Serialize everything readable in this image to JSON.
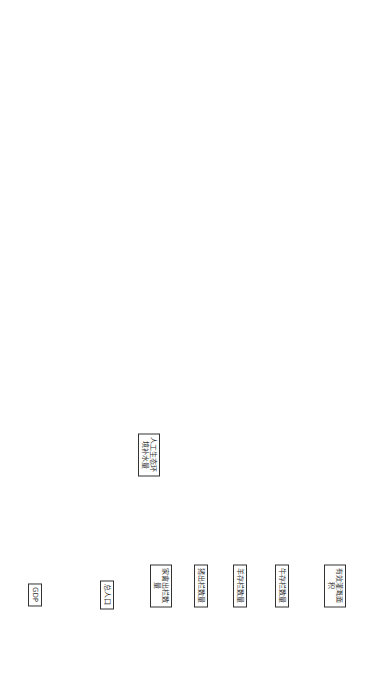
{
  "diagram": {
    "type": "system-dynamics stock-flow diagram",
    "stocks": [
      {
        "id": "s_irrig",
        "label": "有效灌溉面积",
        "x": 45,
        "y": 55
      },
      {
        "id": "s_cattle",
        "label": "牛存栏数量",
        "x": 95,
        "y": 55
      },
      {
        "id": "s_sheep",
        "label": "羊存栏数量",
        "x": 135,
        "y": 55
      },
      {
        "id": "s_pig",
        "label": "猪出栏数量",
        "x": 172,
        "y": 55
      },
      {
        "id": "s_poultry",
        "label": "家禽出栏数量",
        "x": 210,
        "y": 55
      },
      {
        "id": "s_pop",
        "label": "总人口",
        "x": 262,
        "y": 50
      },
      {
        "id": "s_eco",
        "label": "人工生态环境补水量",
        "x": 222,
        "y": 130
      },
      {
        "id": "s_gdp",
        "label": "GDP",
        "x": 330,
        "y": 50
      },
      {
        "id": "s_fert",
        "label": "农业氮肥施用纯量",
        "x": 660,
        "y": 285
      }
    ],
    "nodes": [
      {
        "id": "n1",
        "label": "有效灌溉面积增长率",
        "x": 30,
        "y": 150
      },
      {
        "id": "n2",
        "label": "有效灌溉面积增量",
        "x": 30,
        "y": 95
      },
      {
        "id": "n3",
        "label": "牛数量增长率",
        "x": 30,
        "y": 110
      },
      {
        "id": "n4",
        "label": "牛数量增量",
        "x": 75,
        "y": 90
      },
      {
        "id": "n5",
        "label": "羊数量增长率",
        "x": 45,
        "y": 130
      },
      {
        "id": "n6",
        "label": "羊数量增量",
        "x": 115,
        "y": 90
      },
      {
        "id": "n7",
        "label": "猪数量增长率",
        "x": 60,
        "y": 175
      },
      {
        "id": "n8",
        "label": "猪数量增量",
        "x": 155,
        "y": 95
      },
      {
        "id": "n9",
        "label": "家禽数量增长率",
        "x": 190,
        "y": 145
      },
      {
        "id": "n10",
        "label": "家禽数量增量",
        "x": 200,
        "y": 95
      },
      {
        "id": "n11",
        "label": "<Time>",
        "x": 60,
        "y": 48
      },
      {
        "id": "n12",
        "label": "牛用水定额",
        "x": 80,
        "y": 65
      },
      {
        "id": "n13",
        "label": "牛用水量",
        "x": 70,
        "y": 90
      },
      {
        "id": "n14",
        "label": "灌溉用水定额",
        "x": 80,
        "y": 100
      },
      {
        "id": "n15",
        "label": "灌溉用水量",
        "x": 115,
        "y": 110
      },
      {
        "id": "n16",
        "label": "羊用水定额",
        "x": 110,
        "y": 55
      },
      {
        "id": "n17",
        "label": "羊用水量",
        "x": 125,
        "y": 75
      },
      {
        "id": "n18",
        "label": "猪用水定额",
        "x": 160,
        "y": 55
      },
      {
        "id": "n19",
        "label": "猪用水量",
        "x": 170,
        "y": 80
      },
      {
        "id": "n20",
        "label": "家禽用水定额",
        "x": 190,
        "y": 45
      },
      {
        "id": "n21",
        "label": "家禽用水量",
        "x": 200,
        "y": 80
      },
      {
        "id": "n22",
        "label": "畜牧业用水量",
        "x": 148,
        "y": 120
      },
      {
        "id": "n23",
        "label": "农业用水量",
        "x": 180,
        "y": 165
      },
      {
        "id": "n24",
        "label": "总用水量（不受可供水资源限制）",
        "x": 225,
        "y": 185
      },
      {
        "id": "n25",
        "label": "人工生态环境补水量增长率",
        "x": 200,
        "y": 130
      },
      {
        "id": "n26",
        "label": "人口增长率",
        "x": 275,
        "y": 20
      },
      {
        "id": "n27",
        "label": "人口增长量",
        "x": 262,
        "y": 35
      },
      {
        "id": "n28",
        "label": "农村人口",
        "x": 275,
        "y": 65
      },
      {
        "id": "n29",
        "label": "城镇人口",
        "x": 248,
        "y": 70
      },
      {
        "id": "n30",
        "label": "城镇化率",
        "x": 262,
        "y": 82
      },
      {
        "id": "n31",
        "label": "农村居民人均用水定额",
        "x": 290,
        "y": 75
      },
      {
        "id": "n32",
        "label": "城镇居民人均用水定额",
        "x": 235,
        "y": 95
      },
      {
        "id": "n33",
        "label": "城镇生活用水量",
        "x": 240,
        "y": 105
      },
      {
        "id": "n34",
        "label": "农村生活用水量",
        "x": 280,
        "y": 100
      },
      {
        "id": "n35",
        "label": "居民生活用水量",
        "x": 250,
        "y": 130
      },
      {
        "id": "n36",
        "label": "<Time>",
        "x": 255,
        "y": 110
      },
      {
        "id": "n37",
        "label": "<Time>",
        "x": 305,
        "y": 100
      },
      {
        "id": "n38",
        "label": "单位工业增加值用水量",
        "x": 295,
        "y": 125
      },
      {
        "id": "n39",
        "label": "工业用水量",
        "x": 265,
        "y": 145
      },
      {
        "id": "n40",
        "label": "GDP增长率",
        "x": 345,
        "y": 20
      },
      {
        "id": "n41",
        "label": "GDP增量",
        "x": 340,
        "y": 35
      },
      {
        "id": "n42",
        "label": "工业增加值占GDP比重",
        "x": 340,
        "y": 75
      },
      {
        "id": "n43",
        "label": "工业增加值",
        "x": 310,
        "y": 145
      },
      {
        "id": "n44",
        "label": "工业氨氮排放负荷",
        "x": 300,
        "y": 200
      },
      {
        "id": "n45",
        "label": "工业COD排放负荷",
        "x": 305,
        "y": 250
      },
      {
        "id": "n46",
        "label": "单位工业增加值氨氮排放量",
        "x": 270,
        "y": 250
      },
      {
        "id": "n47",
        "label": "单位工业增加值COD排放量",
        "x": 305,
        "y": 310
      },
      {
        "id": "n48",
        "label": "<Time>",
        "x": 270,
        "y": 290
      },
      {
        "id": "n49",
        "label": "<Time>",
        "x": 320,
        "y": 270
      },
      {
        "id": "n50",
        "label": "<Time>",
        "x": 345,
        "y": 175
      },
      {
        "id": "n51",
        "label": "工业氨氮失水足迹",
        "x": 260,
        "y": 225
      },
      {
        "id": "n52",
        "label": "工业COD失水足迹",
        "x": 250,
        "y": 280
      },
      {
        "id": "n53",
        "label": "<受纳水体氨氮浓度标准上限>",
        "x": 245,
        "y": 265
      },
      {
        "id": "n54",
        "label": "<受纳水体氨氮初始浓度>",
        "x": 240,
        "y": 230
      },
      {
        "id": "n55",
        "label": "<受纳水体COD浓度标准下限>",
        "x": 250,
        "y": 325
      },
      {
        "id": "n56",
        "label": "<受纳水体COD初始浓度>",
        "x": 215,
        "y": 300
      },
      {
        "id": "n57",
        "label": "<受纳水体氨氮浓度标准下限>",
        "x": 215,
        "y": 240
      },
      {
        "id": "n58",
        "label": "<受纳水体COD浓度标准上限>",
        "x": 225,
        "y": 330
      },
      {
        "id": "n59",
        "label": "公共用水量",
        "x": 220,
        "y": 180
      },
      {
        "id": "n60",
        "label": "水资源负债",
        "x": 215,
        "y": 200
      },
      {
        "id": "n61",
        "label": "可供水量",
        "x": 185,
        "y": 205
      },
      {
        "id": "n62",
        "label": "灰水产生量",
        "x": 150,
        "y": 200
      },
      {
        "id": "n63",
        "label": "<Time>",
        "x": 148,
        "y": 225
      },
      {
        "id": "n64",
        "label": "生活污水氨氮灰水足迹",
        "x": 40,
        "y": 165
      },
      {
        "id": "n65",
        "label": "生活污水COD灰水足迹",
        "x": 85,
        "y": 180
      },
      {
        "id": "n66",
        "label": "生活污水氨氮排放负荷",
        "x": 55,
        "y": 130
      },
      {
        "id": "n67",
        "label": "生活污水COD排放负荷",
        "x": 70,
        "y": 160
      },
      {
        "id": "n68",
        "label": "农村生活污水氨氮排放负荷",
        "x": 40,
        "y": 105
      },
      {
        "id": "n69",
        "label": "农村生活污水COD排放负荷",
        "x": 60,
        "y": 115
      },
      {
        "id": "n70",
        "label": "城镇生活污水COD排放负荷",
        "x": 100,
        "y": 155
      },
      {
        "id": "n71",
        "label": "城镇生活污水氨氮排放负荷",
        "x": 120,
        "y": 180
      },
      {
        "id": "n72",
        "label": "城市生活污水处理率",
        "x": 100,
        "y": 175
      },
      {
        "id": "n73",
        "label": "污水厂COD出水浓度",
        "x": 100,
        "y": 130
      },
      {
        "id": "n74",
        "label": "污水厂氨氮出水浓度",
        "x": 100,
        "y": 200
      },
      {
        "id": "n75",
        "label": "<Time>",
        "x": 125,
        "y": 160
      },
      {
        "id": "n76",
        "label": "城镇生活污水COD产生量",
        "x": 120,
        "y": 110
      },
      {
        "id": "n77",
        "label": "城镇生活污水产生量",
        "x": 130,
        "y": 145
      },
      {
        "id": "n78",
        "label": "城镇生活污水氨氮产生量",
        "x": 140,
        "y": 180
      },
      {
        "id": "n79",
        "label": "农村生活污水产生量",
        "x": 110,
        "y": 50
      },
      {
        "id": "n80",
        "label": "农村生活污水COD产生量",
        "x": 110,
        "y": 70
      },
      {
        "id": "n81",
        "label": "<农村生活用水量>",
        "x": 150,
        "y": 45
      },
      {
        "id": "n82",
        "label": "农村生活污水产生系数",
        "x": 150,
        "y": 65
      },
      {
        "id": "n83",
        "label": "<城镇人口>",
        "x": 150,
        "y": 90
      },
      {
        "id": "n84",
        "label": "城镇COD产生系数",
        "x": 155,
        "y": 110
      },
      {
        "id": "n85",
        "label": "城镇生活污水产生系数",
        "x": 150,
        "y": 130
      },
      {
        "id": "n86",
        "label": "<城镇生活用水量>",
        "x": 150,
        "y": 150
      },
      {
        "id": "n87",
        "label": "<城镇人口>",
        "x": 160,
        "y": 175
      },
      {
        "id": "n88",
        "label": "城镇氨氮产生系数",
        "x": 160,
        "y": 190
      },
      {
        "id": "n89",
        "label": "<城镇生活污水氨氮排放负荷>",
        "x": 30,
        "y": 150
      },
      {
        "id": "n90",
        "label": "受纳水体COD浓度标准下限",
        "x": 20,
        "y": 200
      },
      {
        "id": "n91",
        "label": "受纳水体COD浓度标准上限",
        "x": 65,
        "y": 205
      },
      {
        "id": "n92",
        "label": "受纳水体COD初始浓度",
        "x": 85,
        "y": 200
      },
      {
        "id": "n93",
        "label": "<受纳水体氨氮浓度标准上限>",
        "x": 30,
        "y": 55
      },
      {
        "id": "n94",
        "label": "<受纳水体氨氮浓度标准下限>",
        "x": 45,
        "y": 80
      },
      {
        "id": "n95",
        "label": "<受纳水体氨氮初始浓度>",
        "x": 40,
        "y": 30
      },
      {
        "id": "n96",
        "label": "生活污水氨氮灰水足迹",
        "x": 55,
        "y": 75
      },
      {
        "id": "n97",
        "label": "氮肥施用变化量",
        "x": 30,
        "y": 110
      },
      {
        "id": "n98",
        "label": "氮肥施用变化率",
        "x": 30,
        "y": 130
      },
      {
        "id": "n99",
        "label": "氮肥淋失率",
        "x": 80,
        "y": 130
      },
      {
        "id": "n100",
        "label": "种植业灰水足迹",
        "x": 100,
        "y": 145
      },
      {
        "id": "n101",
        "label": "受纳水体氨氮浓度标准上限",
        "x": 30,
        "y": 150
      },
      {
        "id": "n102",
        "label": "受纳水体氨氮浓度标准下限",
        "x": 30,
        "y": 170
      },
      {
        "id": "n103",
        "label": "受纳水体氨氮初始浓度",
        "x": 100,
        "y": 165
      },
      {
        "id": "n104",
        "label": "畜禽养殖业氨氮灰水足迹",
        "x": 130,
        "y": 200
      },
      {
        "id": "n105",
        "label": "<受纳水体氨氮浓度标准下限>",
        "x": 35,
        "y": 195
      },
      {
        "id": "n106",
        "label": "<受纳水体氨氮浓度标准上限>",
        "x": 50,
        "y": 215
      },
      {
        "id": "n107",
        "label": "畜禽养殖业氨氮排放负荷",
        "x": 45,
        "y": 260
      },
      {
        "id": "n108",
        "label": "牛养殖氨氮排放负荷",
        "x": 80,
        "y": 285
      },
      {
        "id": "n109",
        "label": "羊养殖氨氮排放负荷",
        "x": 95,
        "y": 260
      },
      {
        "id": "n110",
        "label": "猪养殖氨氮排放负荷",
        "x": 80,
        "y": 300
      },
      {
        "id": "n111",
        "label": "家禽养殖氨氮排放负荷",
        "x": 80,
        "y": 345
      },
      {
        "id": "n112",
        "label": "每万只家禽排泄物中进入水体的氨氮含量",
        "x": 30,
        "y": 340
      },
      {
        "id": "n113",
        "label": "每万头牛排泄物中进入水体的氨氮含量",
        "x": 120,
        "y": 240
      },
      {
        "id": "n114",
        "label": "每万头羊排泄物中进入水体的氨氮含量",
        "x": 120,
        "y": 280
      },
      {
        "id": "n115",
        "label": "每万头猪排泄物中进入水体的氨氮含量",
        "x": 130,
        "y": 320
      },
      {
        "id": "n116",
        "label": "<牛存栏数量>",
        "x": 140,
        "y": 220
      },
      {
        "id": "n117",
        "label": "<羊存栏数量>",
        "x": 120,
        "y": 265
      },
      {
        "id": "n118",
        "label": "<猪出栏数量>",
        "x": 130,
        "y": 300
      },
      {
        "id": "n119",
        "label": "<家禽出栏数量>",
        "x": 150,
        "y": 345
      },
      {
        "id": "n120",
        "label": "畜禽养殖业COD灰水足迹",
        "x": 205,
        "y": 230
      },
      {
        "id": "n121",
        "label": "畜禽养殖业COD排放负荷",
        "x": 220,
        "y": 300
      },
      {
        "id": "n122",
        "label": "牛养殖COD排放负荷",
        "x": 195,
        "y": 260
      },
      {
        "id": "n123",
        "label": "羊养殖COD排放负荷",
        "x": 180,
        "y": 285
      },
      {
        "id": "n124",
        "label": "猪养殖COD排放负荷",
        "x": 190,
        "y": 325
      },
      {
        "id": "n125",
        "label": "家禽养殖COD排放负荷",
        "x": 175,
        "y": 355
      },
      {
        "id": "n126",
        "label": "每万头牛排泄物中进入水体的COD含量",
        "x": 165,
        "y": 250
      },
      {
        "id": "n127",
        "label": "每万头羊排泄物中进入水体的COD含量",
        "x": 165,
        "y": 300
      },
      {
        "id": "n128",
        "label": "每万头猪排泄物中进入水体的COD含量",
        "x": 165,
        "y": 330
      },
      {
        "id": "n129",
        "label": "每万只家禽排泄物中进入水体的COD含量",
        "x": 210,
        "y": 355
      },
      {
        "id": "n130",
        "label": "<牛存栏数量>",
        "x": 140,
        "y": 235
      },
      {
        "id": "n131",
        "label": "<受纳水体COD初始浓度>",
        "x": 195,
        "y": 225
      },
      {
        "id": "n132",
        "label": "<受纳水体COD浓度标准上限>",
        "x": 235,
        "y": 325
      },
      {
        "id": "n133",
        "label": "<受纳水体COD浓度标准下限>",
        "x": 175,
        "y": 240
      },
      {
        "id": "n134",
        "label": "<家禽出栏数量>",
        "x": 200,
        "y": 365
      },
      {
        "id": "n135",
        "label": "<Time>",
        "x": 185,
        "y": 215
      },
      {
        "id": "n136",
        "label": "灰水产生量",
        "x": 200,
        "y": 210
      }
    ]
  },
  "visible_text_summary": {
    "stocks": [
      "有效灌溉面积",
      "牛存栏数量",
      "羊存栏数量",
      "猪出栏数量",
      "家禽出栏数量",
      "总人口",
      "人工生态环境补水量",
      "GDP",
      "农业氮肥施用纯量"
    ],
    "key_variables": [
      "灰水产生量",
      "总用水量（不受可供水资源限制）",
      "工业氨氮灰水足迹",
      "工业COD灰水足迹",
      "生活污水氨氮灰水足迹",
      "生活污水COD灰水足迹",
      "种植业灰水足迹",
      "畜禽养殖业氨氮灰水足迹",
      "畜禽养殖业COD灰水足迹",
      "水资源负债",
      "可供水量",
      "公共用水量"
    ]
  }
}
